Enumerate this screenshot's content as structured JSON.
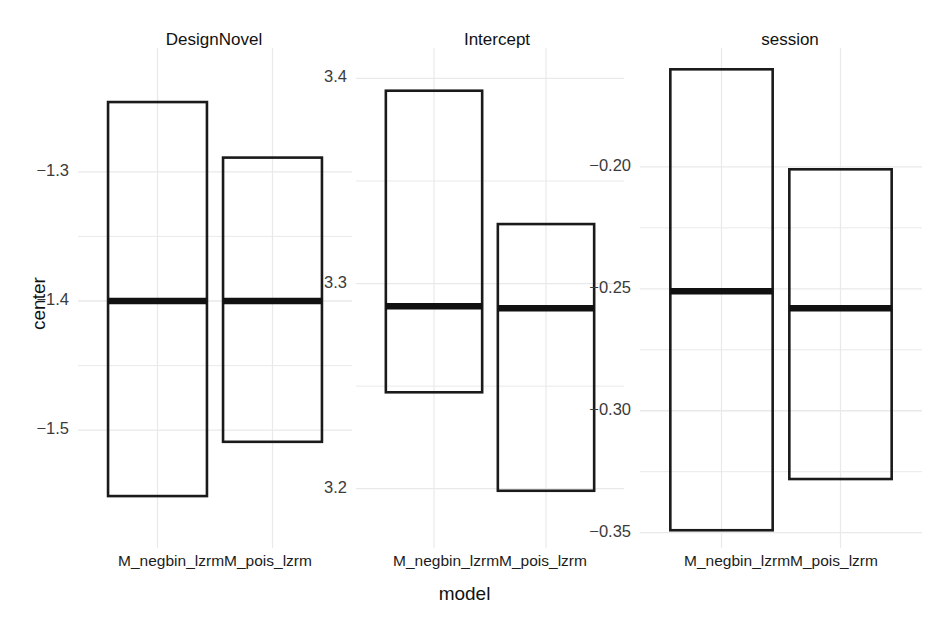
{
  "chart_data": {
    "type": "bar",
    "title": "",
    "subtitle": "",
    "xlabel": "model",
    "ylabel": "center",
    "grid": true,
    "legend": null,
    "facet_variable": "parameter",
    "categories": [
      "M_negbin_lzrm",
      "M_pois_lzrm"
    ],
    "panels": [
      {
        "title": "DesignNovel",
        "ylim": [
          -1.585,
          -1.215
        ],
        "yticks": [
          -1.3,
          -1.4,
          -1.5
        ],
        "ytick_labels": [
          "−1.3",
          "−1.4",
          "−1.5"
        ],
        "boxes": [
          {
            "category": "M_negbin_lzrm",
            "upper": -1.246,
            "center": -1.4,
            "lower": -1.551
          },
          {
            "category": "M_pois_lzrm",
            "upper": -1.289,
            "center": -1.4,
            "lower": -1.509
          }
        ]
      },
      {
        "title": "Intercept",
        "ylim": [
          3.175,
          3.408
        ],
        "yticks": [
          3.4,
          3.3,
          3.2
        ],
        "ytick_labels": [
          "3.4",
          "3.3",
          "3.2"
        ],
        "boxes": [
          {
            "category": "M_negbin_lzrm",
            "upper": 3.394,
            "center": 3.289,
            "lower": 3.247
          },
          {
            "category": "M_pois_lzrm",
            "upper": 3.329,
            "center": 3.288,
            "lower": 3.199
          }
        ]
      },
      {
        "title": "session",
        "ylim": [
          -0.353,
          -0.157
        ],
        "yticks": [
          -0.2,
          -0.25,
          -0.3,
          -0.35
        ],
        "ytick_labels": [
          "−0.20",
          "−0.25",
          "−0.30",
          "−0.35"
        ],
        "boxes": [
          {
            "category": "M_negbin_lzrm",
            "upper": -0.16,
            "center": -0.251,
            "lower": -0.349
          },
          {
            "category": "M_pois_lzrm",
            "upper": -0.201,
            "center": -0.258,
            "lower": -0.328
          }
        ]
      }
    ],
    "colors": {
      "box_stroke": "#1a1a1a",
      "median_stroke": "#111111",
      "grid": "#e9e9e9",
      "background": "#ffffff",
      "text": "#1c1c1c"
    }
  }
}
